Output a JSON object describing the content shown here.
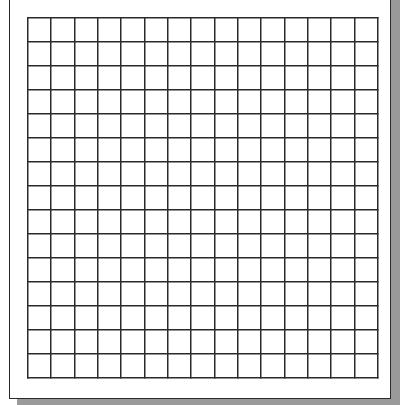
{
  "document": {
    "type": "graph-paper",
    "title": "",
    "grid": {
      "columns": 15,
      "rows": 15,
      "line_color": "#2a2a2a",
      "background": "#ffffff"
    },
    "page": {
      "border_color": "#2a2a2a",
      "shadow_color": "#9a9a9a"
    }
  }
}
